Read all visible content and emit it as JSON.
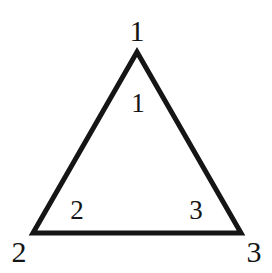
{
  "figure": {
    "type": "triangle-diagram",
    "background_color": "#ffffff",
    "stroke_color": "#151515",
    "stroke_width": 5,
    "label_color": "#151515",
    "vertices": [
      {
        "id": "apex",
        "x": 137,
        "y": 52
      },
      {
        "id": "bottom-left",
        "x": 33,
        "y": 233
      },
      {
        "id": "bottom-right",
        "x": 241,
        "y": 233
      }
    ],
    "vertex_labels": [
      {
        "name": "vertex-label-1",
        "text": "1",
        "x": 137,
        "y": 31
      },
      {
        "name": "vertex-label-2",
        "text": "2",
        "x": 19,
        "y": 252
      },
      {
        "name": "vertex-label-3",
        "text": "3",
        "x": 254,
        "y": 252
      }
    ],
    "interior_labels": [
      {
        "name": "interior-label-1",
        "text": "1",
        "x": 138,
        "y": 103
      },
      {
        "name": "interior-label-2",
        "text": "2",
        "x": 77,
        "y": 210
      },
      {
        "name": "interior-label-3",
        "text": "3",
        "x": 196,
        "y": 210
      }
    ]
  }
}
